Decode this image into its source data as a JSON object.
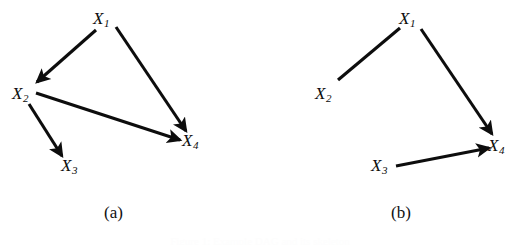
{
  "figure": {
    "background_color": "#ffffff",
    "stroke_color": "#0d0d0d",
    "text_color": "#111111",
    "clipped_caption_text": "Figure 1: Example DAG and its skeleton"
  },
  "panels": [
    {
      "id": "a",
      "caption": "(a)",
      "caption_pos": {
        "x": 104,
        "y": 204
      },
      "nodes": [
        {
          "id": "X1",
          "base": "X",
          "sub": "1",
          "x": 93,
          "y": 10
        },
        {
          "id": "X2",
          "base": "X",
          "sub": "2",
          "x": 12,
          "y": 85
        },
        {
          "id": "X3",
          "base": "X",
          "sub": "3",
          "x": 61,
          "y": 157
        },
        {
          "id": "X4",
          "base": "X",
          "sub": "4",
          "x": 182,
          "y": 132
        }
      ],
      "edges": [
        {
          "from": "X1",
          "to": "X2",
          "type": "directed",
          "x1": 96,
          "y1": 30,
          "x2": 37,
          "y2": 82
        },
        {
          "from": "X1",
          "to": "X4",
          "type": "directed",
          "x1": 116,
          "y1": 27,
          "x2": 186,
          "y2": 131
        },
        {
          "from": "X2",
          "to": "X4",
          "type": "directed",
          "x1": 36,
          "y1": 93,
          "x2": 180,
          "y2": 140
        },
        {
          "from": "X2",
          "to": "X3",
          "type": "directed",
          "x1": 29,
          "y1": 104,
          "x2": 62,
          "y2": 156
        }
      ]
    },
    {
      "id": "b",
      "caption": "(b)",
      "caption_pos": {
        "x": 391,
        "y": 204
      },
      "nodes": [
        {
          "id": "X1",
          "base": "X",
          "sub": "1",
          "x": 399,
          "y": 10
        },
        {
          "id": "X2",
          "base": "X",
          "sub": "2",
          "x": 315,
          "y": 85
        },
        {
          "id": "X3",
          "base": "X",
          "sub": "3",
          "x": 371,
          "y": 157
        },
        {
          "id": "X4",
          "base": "X",
          "sub": "4",
          "x": 488,
          "y": 137
        }
      ],
      "edges": [
        {
          "from": "X2",
          "to": "X1",
          "type": "undirected",
          "x1": 338,
          "y1": 80,
          "x2": 398,
          "y2": 30
        },
        {
          "from": "X1",
          "to": "X4",
          "type": "directed",
          "x1": 421,
          "y1": 29,
          "x2": 492,
          "y2": 134
        },
        {
          "from": "X3",
          "to": "X4",
          "type": "directed",
          "x1": 396,
          "y1": 166,
          "x2": 489,
          "y2": 148
        }
      ]
    }
  ]
}
